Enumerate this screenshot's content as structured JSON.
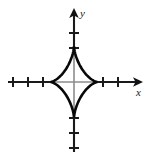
{
  "figure": {
    "title": "",
    "background_color": "#ffffff",
    "width": 151,
    "height": 158,
    "axis_color": "#1a1a1a",
    "axis_inner_color": "#8c8c8c",
    "curve_color": "#080808",
    "x_axis_label": "x",
    "y_axis_label": "y"
  },
  "chart_data": {
    "type": "line",
    "title": "",
    "subtitle": "",
    "xlabel": "x",
    "ylabel": "y",
    "curve_name": "astroid",
    "equation": "x^(2/3) + y^(2/3) = a^(2/3)",
    "parametric": "x = a*cos^3(t), y = a*sin^3(t)",
    "grid": false,
    "legend": null,
    "axes": {
      "origin_px": [
        74,
        82
      ],
      "x_axis_from_px": [
        8,
        82
      ],
      "x_axis_to_px": [
        143,
        82
      ],
      "y_axis_from_px": [
        74,
        152
      ],
      "y_axis_to_px": [
        74,
        8
      ],
      "x_arrow": "right",
      "y_arrow": "up",
      "xlim": [
        -4.4,
        4.6
      ],
      "ylim": [
        -4.7,
        4.9
      ],
      "tick_spacing_units": 1
    },
    "x_ticks_px": [
      13,
      28,
      43,
      58,
      103,
      118
    ],
    "y_ticks_px": [
      33,
      48,
      63,
      103,
      118,
      133,
      148
    ],
    "x_tick_labels": [],
    "y_tick_labels": [],
    "astroid": {
      "center_px": [
        74,
        82
      ],
      "radius_x_px": 23.5,
      "radius_y_px": 35.5,
      "cusps_px": [
        [
          97.5,
          82
        ],
        [
          74,
          46.5
        ],
        [
          50.5,
          82
        ],
        [
          74,
          117.5
        ]
      ],
      "cusps_units": [
        [
          1.5,
          0
        ],
        [
          0,
          1.5
        ],
        [
          -1.5,
          0
        ],
        [
          0,
          -1.5
        ]
      ],
      "radius_units": 1.5,
      "points_sampled": 200
    }
  }
}
